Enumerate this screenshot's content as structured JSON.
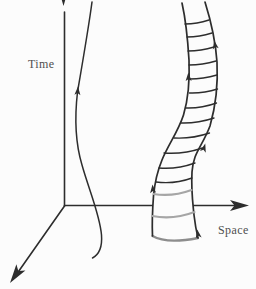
{
  "figure": {
    "kind": "spacetime-diagram"
  },
  "colors": {
    "background": "#fcfcfc",
    "ink": "#2d2d2d",
    "label": "#4f4f4f",
    "gray_rung": "#a6a6a6",
    "cap": "#8d8d8d"
  },
  "labels": {
    "time": "Time",
    "space": "Space"
  },
  "axes": [
    {
      "name": "time-axis",
      "label": "Time",
      "direction": "up"
    },
    {
      "name": "space-axis",
      "label": "Space",
      "direction": "right"
    },
    {
      "name": "second-space-axis",
      "label": "",
      "direction": "down-left"
    }
  ],
  "tube": {
    "rungs": [
      {
        "x1": 185,
        "y1": 24,
        "x2": 209,
        "y2": 20,
        "sag": 2,
        "tone": "ink"
      },
      {
        "x1": 187,
        "y1": 37,
        "x2": 212,
        "y2": 33,
        "sag": 2,
        "tone": "ink"
      },
      {
        "x1": 188,
        "y1": 51,
        "x2": 214,
        "y2": 47,
        "sag": 2,
        "tone": "ink"
      },
      {
        "x1": 189,
        "y1": 65,
        "x2": 216,
        "y2": 61,
        "sag": 2,
        "tone": "ink"
      },
      {
        "x1": 189.5,
        "y1": 79,
        "x2": 217,
        "y2": 75,
        "sag": 2,
        "tone": "ink"
      },
      {
        "x1": 189.5,
        "y1": 93,
        "x2": 217.5,
        "y2": 89,
        "sag": 2.5,
        "tone": "ink"
      },
      {
        "x1": 186,
        "y1": 108,
        "x2": 216.5,
        "y2": 103,
        "sag": 3,
        "tone": "ink"
      },
      {
        "x1": 181,
        "y1": 123,
        "x2": 214,
        "y2": 118,
        "sag": 3,
        "tone": "ink"
      },
      {
        "x1": 174,
        "y1": 138,
        "x2": 209.5,
        "y2": 133,
        "sag": 3.5,
        "tone": "ink"
      },
      {
        "x1": 164,
        "y1": 153,
        "x2": 202.5,
        "y2": 148,
        "sag": 4,
        "tone": "ink"
      },
      {
        "x1": 159,
        "y1": 168,
        "x2": 195,
        "y2": 163,
        "sag": 4,
        "tone": "ink"
      },
      {
        "x1": 156,
        "y1": 182,
        "x2": 192,
        "y2": 178,
        "sag": 4.5,
        "tone": "ink"
      },
      {
        "x1": 153.5,
        "y1": 194,
        "x2": 191.5,
        "y2": 190,
        "sag": 5,
        "tone": "gray"
      },
      {
        "x1": 152.3,
        "y1": 216,
        "x2": 194.5,
        "y2": 212,
        "sag": 6,
        "tone": "gray"
      }
    ],
    "arrowheads": [
      {
        "x": 215,
        "y": 45,
        "angle": -11,
        "on": "tube-right-edge"
      },
      {
        "x": 188.5,
        "y": 77,
        "angle": -2,
        "on": "tube-left-edge"
      },
      {
        "x": 204,
        "y": 148,
        "angle": 16,
        "on": "tube-right-edge"
      },
      {
        "x": 152.8,
        "y": 189,
        "angle": -4,
        "on": "tube-left-edge"
      },
      {
        "x": 198,
        "y": 234,
        "angle": -10,
        "on": "tube-right-edge"
      },
      {
        "x": 77.7,
        "y": 91,
        "angle": 4,
        "on": "worldline"
      }
    ]
  }
}
